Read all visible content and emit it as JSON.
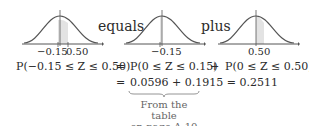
{
  "figure": {
    "words": {
      "equals": "equals",
      "plus": "plus"
    },
    "curves": [
      {
        "id": "left",
        "labels": [
          "−0.15",
          "0.50"
        ],
        "shade_from": -0.15,
        "shade_to": 0.5
      },
      {
        "id": "middle",
        "labels": [
          "−0.15"
        ],
        "shade_from": -0.15,
        "shade_to": 0
      },
      {
        "id": "right",
        "labels": [
          "0.50"
        ],
        "shade_from": 0,
        "shade_to": 0.5
      }
    ],
    "shade_color": "#e3e3e3",
    "curve_color": "#555555"
  },
  "equations": {
    "lhs": "P(−0.15 ≤ Z ≤ 0.50)",
    "eq1": "=",
    "term1": "P(0 ≤ Z ≤ 0.15)",
    "plus": "+",
    "term2": "P(0 ≤ Z ≤ 0.50)",
    "eq2": "=",
    "line2": "0.0596 + 0.1915 = 0.2511"
  },
  "note": {
    "line1": "From the table",
    "line2": "on page A-10"
  }
}
